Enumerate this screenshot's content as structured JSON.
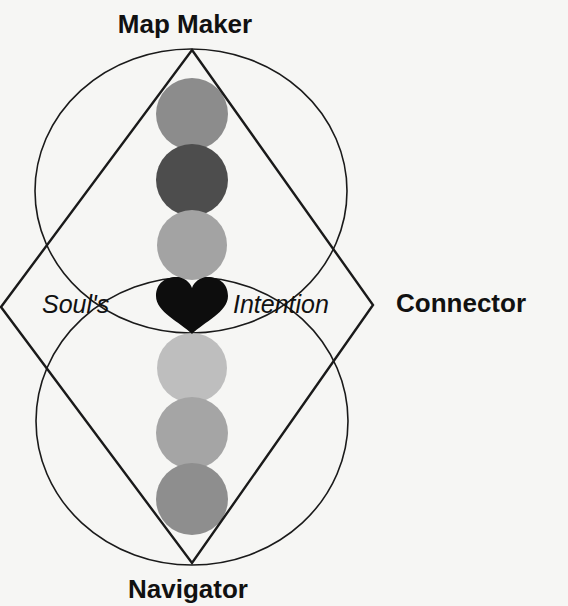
{
  "diagram": {
    "labels": {
      "top": "Map Maker",
      "right": "Connector",
      "bottom": "Navigator",
      "center_left": "Soul's",
      "center_right": "Intention"
    },
    "center_symbol": "heart-icon",
    "upper_discs": [
      {
        "position": 1,
        "color": "#8c8c8c"
      },
      {
        "position": 2,
        "color": "#4d4d4d"
      },
      {
        "position": 3,
        "color": "#a3a3a3"
      }
    ],
    "lower_discs": [
      {
        "position": 1,
        "color": "#bebebe"
      },
      {
        "position": 2,
        "color": "#a5a5a5"
      },
      {
        "position": 3,
        "color": "#8e8e8e"
      }
    ],
    "colors": {
      "background": "#f6f6f4",
      "line": "#1a1a1a",
      "heart": "#0d0d0d",
      "text": "#111111"
    }
  }
}
